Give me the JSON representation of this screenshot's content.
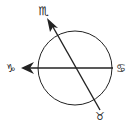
{
  "diagram": {
    "type": "astrological-aspect-diagram",
    "circle": {
      "cx": 75,
      "cy": 68,
      "r": 37
    },
    "stroke_color": "#222222",
    "background": "#ffffff",
    "axes": [
      {
        "name": "horizontal-axis",
        "from_sign": "Cancer",
        "to_sign": "Capricorn",
        "arrow_at": "Capricorn"
      },
      {
        "name": "diagonal-axis",
        "from_sign": "Taurus",
        "to_sign": "Scorpio",
        "arrow_at": "Scorpio"
      }
    ],
    "labels": {
      "top": "♏",
      "left": "♑",
      "right": "♋",
      "bottom": "♉"
    }
  }
}
